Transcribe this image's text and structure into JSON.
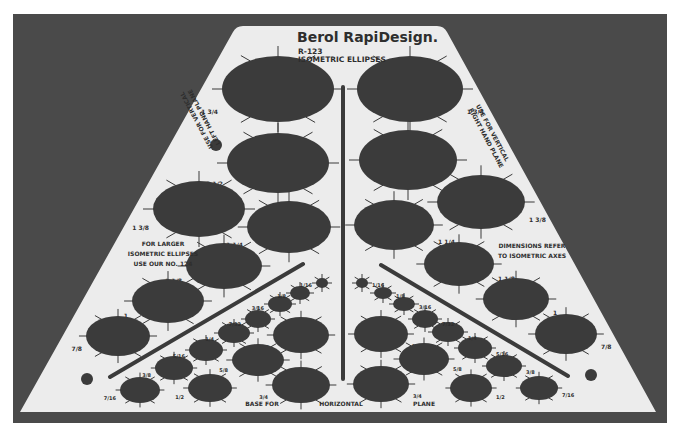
{
  "colors": {
    "page_bg": "#ffffff",
    "photo_bg": "#4a4a4a",
    "stencil": "#ececec",
    "hole": "#3b3b3b",
    "ink": "#2e2e2e"
  },
  "stencil": {
    "brand": "Berol RapiDesign.",
    "model": "R-123",
    "title": "ISOMETRIC ELLIPSES",
    "left_plane_note_line1": "USE FOR VERTICAL",
    "left_plane_note_line2": "LEFT HAND PLANE",
    "right_plane_note_line1": "USE FOR VERTICAL",
    "right_plane_note_line2": "RIGHT HAND PLANE",
    "larger_note_line1": "FOR LARGER",
    "larger_note_line2": "ISOMETRIC ELLIPSES",
    "larger_note_line3": "USE OUR NO. 124",
    "dimensions_note_line1": "DIMENSIONS REFER",
    "dimensions_note_line2": "TO ISOMETRIC AXES",
    "base_label_1": "BASE FOR",
    "base_label_2": "HORIZONTAL",
    "base_label_3": "PLANE"
  },
  "ellipses": [
    {
      "cx": 278,
      "cy": 89,
      "rx": 56,
      "ry": 33,
      "rot": 0,
      "size": "1 3/4"
    },
    {
      "cx": 410,
      "cy": 89,
      "rx": 53,
      "ry": 33,
      "rot": 0,
      "size": "1 3/4"
    },
    {
      "cx": 278,
      "cy": 163,
      "rx": 51,
      "ry": 30,
      "rot": 0,
      "size": "1 1/2"
    },
    {
      "cx": 408,
      "cy": 160,
      "rx": 49,
      "ry": 30,
      "rot": 0,
      "size": "1 1/2"
    },
    {
      "cx": 199,
      "cy": 209,
      "rx": 46,
      "ry": 28,
      "rot": 0,
      "size": "1 3/8"
    },
    {
      "cx": 289,
      "cy": 227,
      "rx": 42,
      "ry": 26,
      "rot": 0,
      "size": "1 1/4"
    },
    {
      "cx": 394,
      "cy": 225,
      "rx": 40,
      "ry": 25,
      "rot": 0,
      "size": "1 1/4"
    },
    {
      "cx": 481,
      "cy": 202,
      "rx": 44,
      "ry": 27,
      "rot": 0,
      "size": "1 3/8"
    },
    {
      "cx": 224,
      "cy": 266,
      "rx": 38,
      "ry": 23,
      "rot": 0,
      "size": "1 1/8"
    },
    {
      "cx": 459,
      "cy": 264,
      "rx": 35,
      "ry": 22,
      "rot": 0,
      "size": "1 1/8"
    },
    {
      "cx": 168,
      "cy": 301,
      "rx": 36,
      "ry": 22,
      "rot": 0,
      "size": "1"
    },
    {
      "cx": 516,
      "cy": 299,
      "rx": 33,
      "ry": 21,
      "rot": 0,
      "size": "1"
    },
    {
      "cx": 118,
      "cy": 336,
      "rx": 32,
      "ry": 20,
      "rot": 0,
      "size": "7/8"
    },
    {
      "cx": 566,
      "cy": 334,
      "rx": 31,
      "ry": 20,
      "rot": 0,
      "size": "7/8"
    },
    {
      "cx": 301,
      "cy": 335,
      "rx": 28,
      "ry": 18,
      "rot": 0,
      "size": "3/4"
    },
    {
      "cx": 381,
      "cy": 334,
      "rx": 27,
      "ry": 18,
      "rot": 0,
      "size": "3/4"
    },
    {
      "cx": 258,
      "cy": 360,
      "rx": 26,
      "ry": 16,
      "rot": 0,
      "size": "5/8"
    },
    {
      "cx": 424,
      "cy": 359,
      "rx": 25,
      "ry": 16,
      "rot": 0,
      "size": "5/8"
    },
    {
      "cx": 301,
      "cy": 385,
      "rx": 29,
      "ry": 18,
      "rot": 0,
      "size": "3/4"
    },
    {
      "cx": 381,
      "cy": 384,
      "rx": 28,
      "ry": 18,
      "rot": 0,
      "size": "3/4"
    },
    {
      "cx": 210,
      "cy": 388,
      "rx": 22,
      "ry": 14,
      "rot": 0,
      "size": "1/2"
    },
    {
      "cx": 471,
      "cy": 388,
      "rx": 21,
      "ry": 14,
      "rot": 0,
      "size": "1/2"
    },
    {
      "cx": 140,
      "cy": 390,
      "rx": 20,
      "ry": 13,
      "rot": 0,
      "size": "7/16"
    },
    {
      "cx": 539,
      "cy": 388,
      "rx": 19,
      "ry": 12,
      "rot": 0,
      "size": "7/16"
    },
    {
      "cx": 174,
      "cy": 368,
      "rx": 19,
      "ry": 12,
      "rot": 0,
      "size": "3/8"
    },
    {
      "cx": 504,
      "cy": 366,
      "rx": 18,
      "ry": 11,
      "rot": 0,
      "size": "3/8"
    },
    {
      "cx": 206,
      "cy": 350,
      "rx": 17,
      "ry": 11,
      "rot": 0,
      "size": "5/16"
    },
    {
      "cx": 475,
      "cy": 348,
      "rx": 17,
      "ry": 11,
      "rot": 0,
      "size": "5/16"
    },
    {
      "cx": 234,
      "cy": 333,
      "rx": 16,
      "ry": 10,
      "rot": 0,
      "size": "1/4"
    },
    {
      "cx": 448,
      "cy": 332,
      "rx": 16,
      "ry": 10,
      "rot": 0,
      "size": "1/4"
    },
    {
      "cx": 258,
      "cy": 319,
      "rx": 13,
      "ry": 9,
      "rot": 0,
      "size": "7/32"
    },
    {
      "cx": 425,
      "cy": 319,
      "rx": 13,
      "ry": 9,
      "rot": 0,
      "size": "7/32"
    },
    {
      "cx": 280,
      "cy": 304,
      "rx": 12,
      "ry": 8,
      "rot": 0,
      "size": "3/16"
    },
    {
      "cx": 404,
      "cy": 304,
      "rx": 11,
      "ry": 7,
      "rot": 0,
      "size": "3/16"
    },
    {
      "cx": 300,
      "cy": 293,
      "rx": 10,
      "ry": 7,
      "rot": 0,
      "size": "1/8"
    },
    {
      "cx": 383,
      "cy": 293,
      "rx": 9,
      "ry": 6,
      "rot": 0,
      "size": "1/8"
    },
    {
      "cx": 322,
      "cy": 283,
      "rx": 6,
      "ry": 5,
      "rot": 0,
      "size": "1/16"
    },
    {
      "cx": 362,
      "cy": 283,
      "rx": 6,
      "ry": 5,
      "rot": 0,
      "size": "1/16"
    }
  ],
  "dots": [
    {
      "cx": 216,
      "cy": 145,
      "r": 6
    },
    {
      "cx": 87,
      "cy": 379,
      "r": 6
    },
    {
      "cx": 591,
      "cy": 375,
      "r": 6
    }
  ]
}
